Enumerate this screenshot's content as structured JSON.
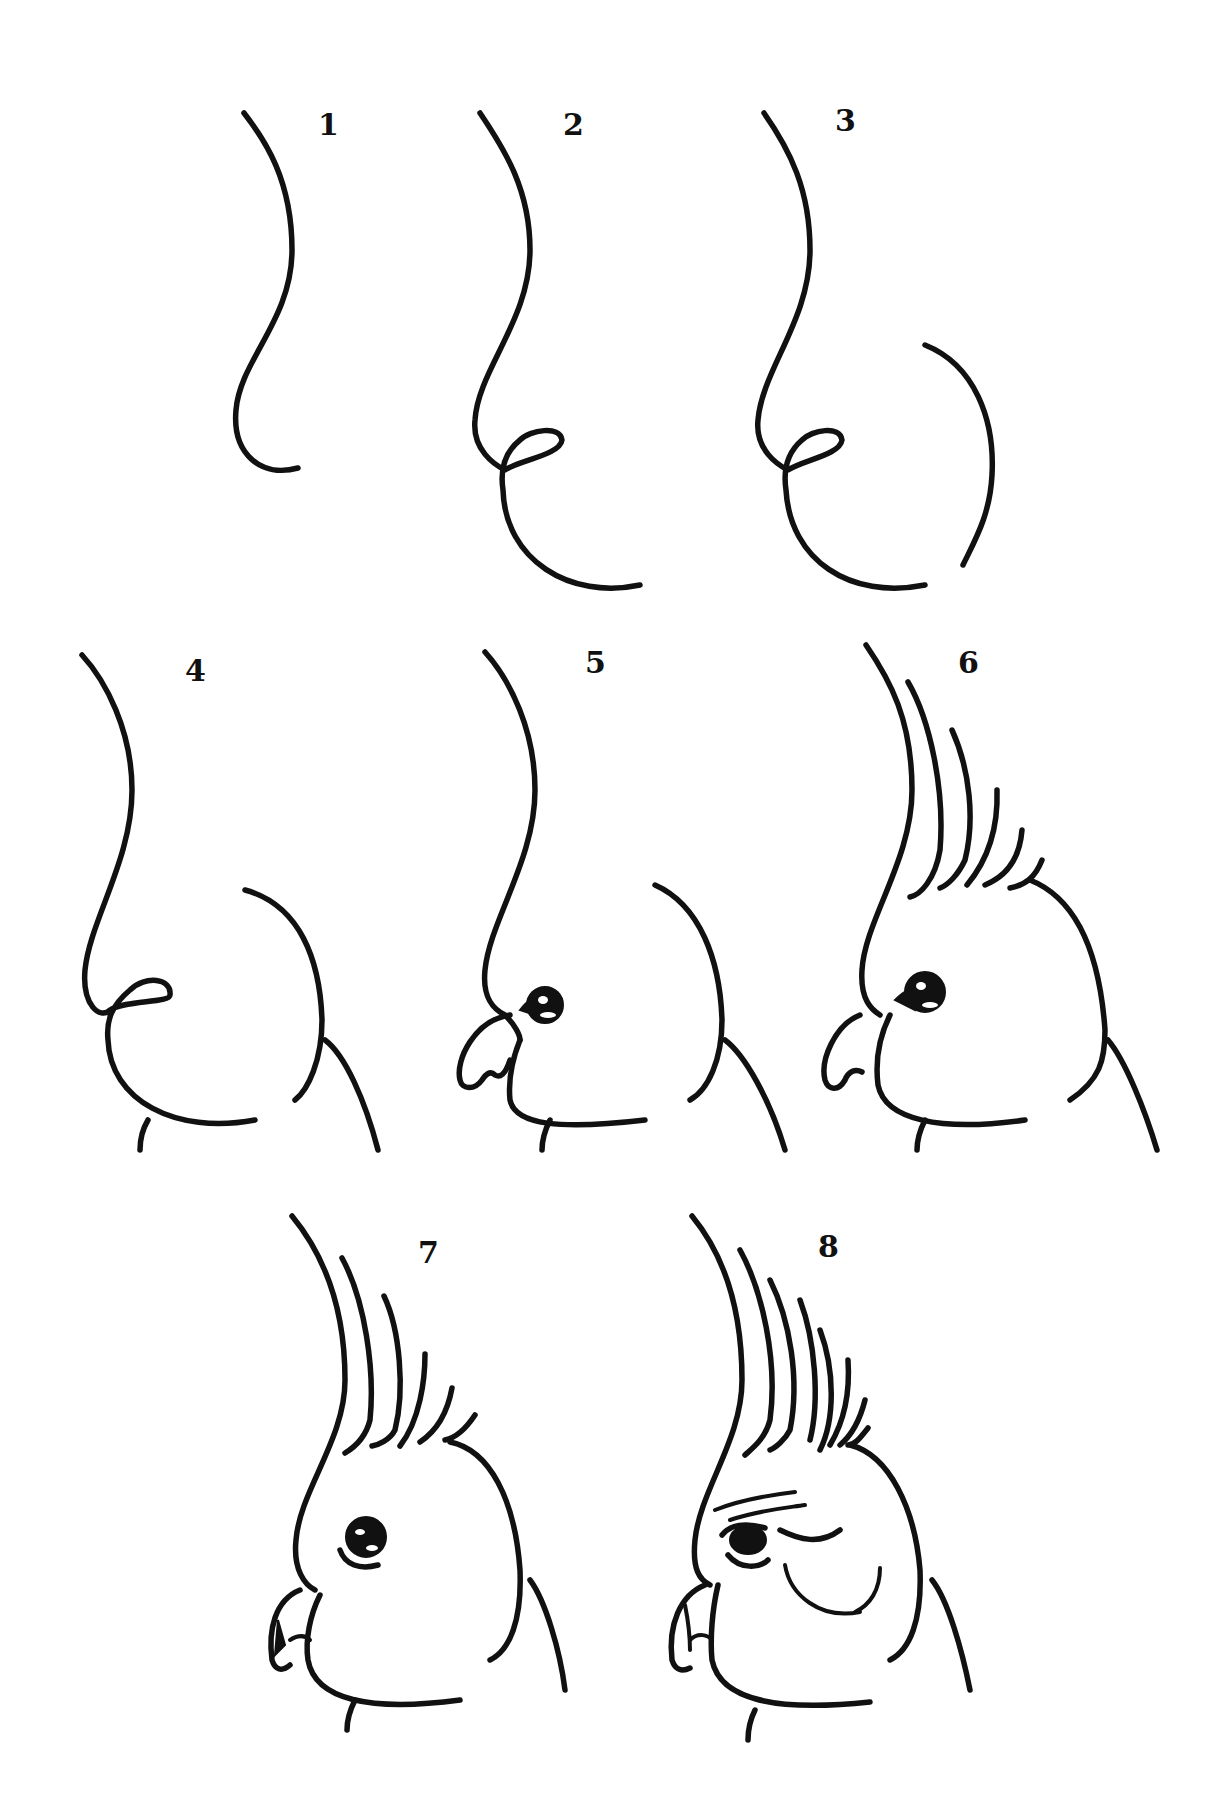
{
  "steps": [
    {
      "label": "1",
      "description": "S-curve for forehead and throat"
    },
    {
      "label": "2",
      "description": "Add loop for beak and curve for cheek"
    },
    {
      "label": "3",
      "description": "Add back-of-head arc"
    },
    {
      "label": "4",
      "description": "Add neck lines"
    },
    {
      "label": "5",
      "description": "Add eye and beak"
    },
    {
      "label": "6",
      "description": "Add crest feathers"
    },
    {
      "label": "7",
      "description": "Refine crest tips, beak and eye details"
    },
    {
      "label": "8",
      "description": "Add shading on crest, brow and cheek patch"
    }
  ],
  "colors": {
    "ink": "#111111",
    "paper": "#ffffff"
  }
}
